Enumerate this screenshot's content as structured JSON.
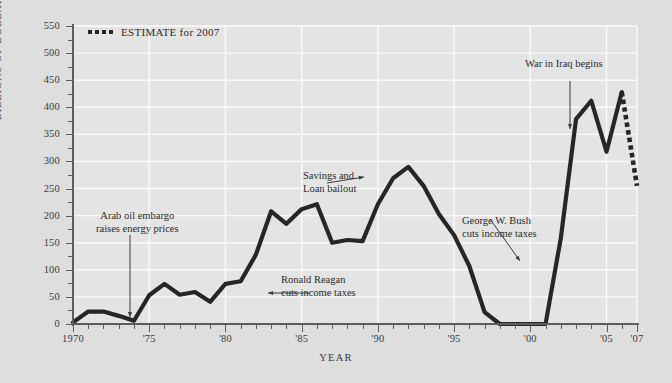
{
  "chart_data": {
    "type": "line",
    "title": "",
    "xlabel": "YEAR",
    "ylabel": "BILLIONS OF DOLLARS",
    "xlim": [
      1970,
      2007
    ],
    "ylim": [
      0,
      550
    ],
    "ytick_step": 50,
    "grid": true,
    "legend_position": "top-left",
    "x": [
      1970,
      1971,
      1972,
      1973,
      1974,
      1975,
      1976,
      1977,
      1978,
      1979,
      1980,
      1981,
      1982,
      1983,
      1984,
      1985,
      1986,
      1987,
      1988,
      1989,
      1990,
      1991,
      1992,
      1993,
      1994,
      1995,
      1996,
      1997,
      1998,
      1999,
      2000,
      2001,
      2002,
      2003,
      2004,
      2005,
      2006
    ],
    "series": [
      {
        "name": "Deficit",
        "style": "solid",
        "values": [
          3,
          23,
          23,
          15,
          6,
          53,
          74,
          54,
          59,
          41,
          74,
          79,
          128,
          208,
          185,
          212,
          221,
          150,
          155,
          153,
          221,
          269,
          290,
          255,
          203,
          164,
          107,
          22,
          0,
          0,
          0,
          0,
          158,
          378,
          412,
          318,
          428
        ]
      },
      {
        "name": "ESTIMATE for 2007",
        "style": "dotted",
        "x": [
          2006,
          2007
        ],
        "values": [
          428,
          255
        ]
      }
    ],
    "y_tick_labels": [
      "0",
      "50",
      "100",
      "150",
      "200",
      "250",
      "300",
      "350",
      "400",
      "450",
      "500",
      "550"
    ],
    "x_tick_labels": [
      {
        "year": 1970,
        "label": "1970"
      },
      {
        "year": 1975,
        "label": "'75"
      },
      {
        "year": 1980,
        "label": "'80"
      },
      {
        "year": 1985,
        "label": "'85"
      },
      {
        "year": 1990,
        "label": "'90"
      },
      {
        "year": 1995,
        "label": "'95"
      },
      {
        "year": 2000,
        "label": "'00"
      },
      {
        "year": 2005,
        "label": "'05"
      },
      {
        "year": 2007,
        "label": "'07"
      }
    ],
    "annotations": [
      {
        "id": "oil",
        "line1": "Arab oil embargo",
        "line2": "raises energy prices"
      },
      {
        "id": "reagan",
        "line1": "Ronald Reagan",
        "line2": "cuts income taxes"
      },
      {
        "id": "snl",
        "line1": "Savings and",
        "line2": "Loan bailout"
      },
      {
        "id": "bush",
        "line1": "George W. Bush",
        "line2": "cuts income taxes"
      },
      {
        "id": "iraq",
        "line1": "War in Iraq begins",
        "line2": ""
      }
    ],
    "colors": {
      "background": "#dedede",
      "plot_background": "#e4e4e4",
      "gridline": "#fbfbfb",
      "data_line": "#262626",
      "axis": "#5d5d5d",
      "text": "#2b2b2b"
    }
  },
  "legend": {
    "label": "ESTIMATE for 2007"
  },
  "axis_titles": {
    "y": "BILLIONS OF DOLLARS",
    "x": "YEAR"
  },
  "ylabels": {
    "v0": "0",
    "v50": "50",
    "v100": "100",
    "v150": "150",
    "v200": "200",
    "v250": "250",
    "v300": "300",
    "v350": "350",
    "v400": "400",
    "v450": "450",
    "v500": "500",
    "v550": "550"
  },
  "xlabels": {
    "y1970": "1970",
    "y1975": "'75",
    "y1980": "'80",
    "y1985": "'85",
    "y1990": "'90",
    "y1995": "'95",
    "y2000": "'00",
    "y2005": "'05",
    "y2007": "'07"
  },
  "annotations": {
    "oil": {
      "line1": "Arab oil embargo",
      "line2": "raises energy prices"
    },
    "reagan": {
      "line1": "Ronald Reagan",
      "line2": "cuts income taxes"
    },
    "snl": {
      "line1": "Savings and",
      "line2": "Loan bailout"
    },
    "bush": {
      "line1": "George W. Bush",
      "line2": "cuts income taxes"
    },
    "iraq": {
      "line1": "War in Iraq begins"
    }
  }
}
